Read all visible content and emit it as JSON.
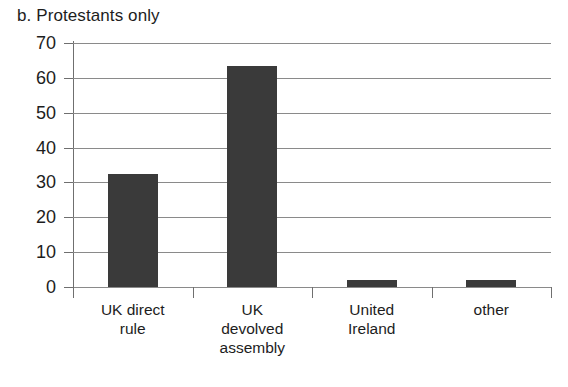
{
  "chart_data": {
    "type": "bar",
    "title": "b. Protestants only",
    "xlabel": "",
    "ylabel": "",
    "categories": [
      "UK direct rule",
      "UK devolved assembly",
      "United Ireland",
      "other"
    ],
    "category_lines": [
      [
        "UK direct",
        "rule"
      ],
      [
        "UK",
        "devolved",
        "assembly"
      ],
      [
        "United",
        "Ireland"
      ],
      [
        "other"
      ]
    ],
    "values": [
      32.5,
      63.5,
      2,
      2
    ],
    "ylim": [
      0,
      70
    ],
    "yticks": [
      0,
      10,
      20,
      30,
      40,
      50,
      60,
      70
    ],
    "ytick_labels": [
      "0",
      "10",
      "20",
      "30",
      "40",
      "50",
      "60",
      "70"
    ],
    "grid": true,
    "grid_axis": "y",
    "legend": false,
    "legend_position": "none",
    "bar_color": "#3a3a3a",
    "grid_color": "#8a8a8a",
    "axis_color": "#6f6f6f",
    "background": "#ffffff"
  }
}
